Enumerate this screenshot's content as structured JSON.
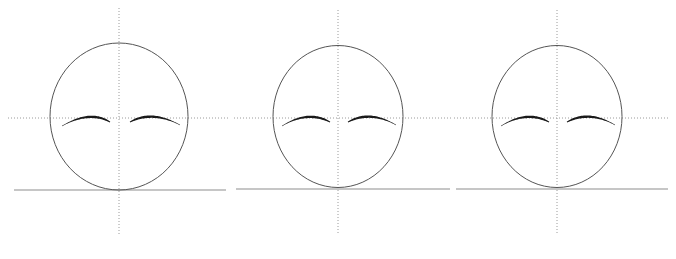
{
  "figure": {
    "title": "",
    "canvas": {
      "width": 676,
      "height": 259,
      "background": "#ffffff"
    },
    "panel_count": 3,
    "styles": {
      "outline_color": "#555555",
      "outline_width": 1,
      "axis_color": "#9a9a9a",
      "axis_dash": "1,2",
      "axis_width": 1,
      "baseline_color": "#8e8e8e",
      "baseline_width": 1.2,
      "eye_color": "#1a1a1a",
      "eye_max_width": 3.4
    },
    "panels": [
      {
        "name": "panel-1",
        "label": "",
        "ellipse": {
          "cx": 119,
          "cy": 116.5,
          "rx": 69,
          "ry": 73.5
        },
        "vertical_axis": {
          "x": 119,
          "y1": 8,
          "y2": 236
        },
        "horizontal_axis": {
          "y": 118,
          "x1": 8,
          "x2": 228
        },
        "baseline": {
          "y": 190,
          "x1": 14,
          "x2": 226
        },
        "eye_left": {
          "x1": 62,
          "y1": 126,
          "cx": 90,
          "cy": 110,
          "x2": 110,
          "y2": 122,
          "taper": "thin-start"
        },
        "eye_right": {
          "x1": 130,
          "y1": 122,
          "cx": 152,
          "cy": 110,
          "x2": 180,
          "y2": 125,
          "taper": "thin-end"
        }
      },
      {
        "name": "panel-2",
        "label": "",
        "ellipse": {
          "cx": 338,
          "cy": 116.5,
          "rx": 65,
          "ry": 71
        },
        "vertical_axis": {
          "x": 338,
          "y1": 10,
          "y2": 234
        },
        "horizontal_axis": {
          "y": 118,
          "x1": 234,
          "x2": 452
        },
        "baseline": {
          "y": 189,
          "x1": 236,
          "x2": 450
        },
        "eye_left": {
          "x1": 282,
          "y1": 126,
          "cx": 308,
          "cy": 110,
          "x2": 330,
          "y2": 122,
          "taper": "thin-start"
        },
        "eye_right": {
          "x1": 348,
          "y1": 122,
          "cx": 370,
          "cy": 110,
          "x2": 396,
          "y2": 125,
          "taper": "thin-end"
        }
      },
      {
        "name": "panel-3",
        "label": "",
        "ellipse": {
          "cx": 557,
          "cy": 116.5,
          "rx": 65,
          "ry": 71
        },
        "vertical_axis": {
          "x": 557,
          "y1": 10,
          "y2": 234
        },
        "horizontal_axis": {
          "y": 118,
          "x1": 454,
          "x2": 670
        },
        "baseline": {
          "y": 189,
          "x1": 456,
          "x2": 668
        },
        "eye_left": {
          "x1": 501,
          "y1": 126,
          "cx": 527,
          "cy": 110,
          "x2": 549,
          "y2": 122,
          "taper": "thin-start"
        },
        "eye_right": {
          "x1": 567,
          "y1": 122,
          "cx": 589,
          "cy": 110,
          "x2": 615,
          "y2": 125,
          "taper": "thin-end"
        }
      }
    ]
  }
}
